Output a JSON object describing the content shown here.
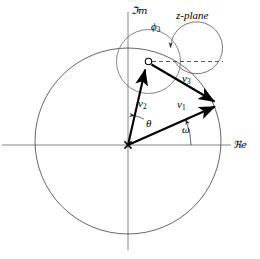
{
  "figure": {
    "title": "z-plane",
    "axes": {
      "imaginary_label": "ℑm",
      "real_label": "ℜe",
      "real_axis_y": 145,
      "imag_axis_x": 128,
      "real_axis_x_start": 2,
      "real_axis_x_end": 231,
      "imag_axis_y_start": 12,
      "imag_axis_y_end": 250
    },
    "unit_circle": {
      "name": "unit-circle",
      "cx": 128,
      "cy": 141,
      "r": 93,
      "stroke": "#555555"
    },
    "small_circle": {
      "name": "phase-circle",
      "cx": 148.5,
      "cy": 61.5,
      "r": 32,
      "stroke": "#777777"
    },
    "origin_marker": {
      "name": "origin-cross",
      "x": 128,
      "y": 145,
      "glyph": "x"
    },
    "pole_marker": {
      "name": "zero-marker",
      "x": 148.5,
      "y": 61.5,
      "r": 3.2,
      "style": "open-circle"
    },
    "reference_line": {
      "name": "horizontal-dashed-reference",
      "x1": 152,
      "y1": 61.5,
      "x2": 223,
      "y2": 61.5,
      "dash": "4 3"
    },
    "vectors": [
      {
        "id": "v1",
        "label": "v",
        "subscript": "1",
        "from_x": 128,
        "from_y": 145,
        "to_x": 218,
        "to_y": 105,
        "description": "vector from origin to point on unit circle at angle omega"
      },
      {
        "id": "v2",
        "label": "v",
        "subscript": "2",
        "from_x": 128,
        "from_y": 145,
        "to_x": 146,
        "to_y": 66,
        "description": "vector from origin to the zero marker at angle theta"
      },
      {
        "id": "v3",
        "label": "v",
        "subscript": "3",
        "from_x": 151,
        "from_y": 64,
        "to_x": 217,
        "to_y": 102,
        "description": "difference vector from zero marker to point on unit circle"
      }
    ],
    "angles": [
      {
        "id": "theta",
        "label": "θ",
        "vertex_x": 128,
        "vertex_y": 145,
        "radius": 30,
        "start_deg": 77,
        "end_deg": 103,
        "description": "angle of v2 measured from the imaginary axis"
      },
      {
        "id": "omega",
        "label": "ω",
        "vertex_x": 128,
        "vertex_y": 145,
        "radius": 63,
        "start_deg": 0,
        "end_deg": 24,
        "description": "angle of v1 measured from the real axis"
      },
      {
        "id": "phi3",
        "label": "ϕ",
        "subscript": "3",
        "vertex_x": 148.5,
        "vertex_y": 61.5,
        "radius": 26,
        "start_deg": 0,
        "end_deg": 330,
        "description": "phase angle of v3 measured at the zero marker from the dashed reference"
      }
    ],
    "colors": {
      "ink": "#000000",
      "circle_gray": "#555555",
      "small_circle_gray": "#777777",
      "axis_gray": "#777777",
      "background": "#ffffff"
    }
  }
}
